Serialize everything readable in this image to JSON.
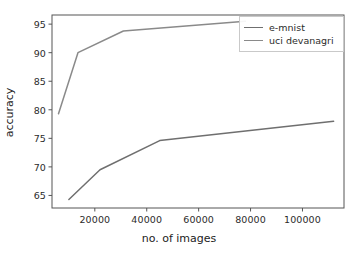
{
  "chart_data": {
    "type": "line",
    "title": "",
    "xlabel": "no. of images",
    "ylabel": "accuracy",
    "xlim": [
      3500,
      116000
    ],
    "ylim": [
      62.8,
      96.6
    ],
    "xticks": [
      20000,
      40000,
      60000,
      80000,
      100000
    ],
    "xtick_labels": [
      "20000",
      "40000",
      "60000",
      "80000",
      "100000"
    ],
    "yticks": [
      65,
      70,
      75,
      80,
      85,
      90,
      95
    ],
    "ytick_labels": [
      "65",
      "70",
      "75",
      "80",
      "85",
      "90",
      "95"
    ],
    "grid": false,
    "legend_position": "upper right",
    "series": [
      {
        "name": "e-mnist",
        "color": "#6f6f6f",
        "x": [
          10000,
          22000,
          45000,
          112000
        ],
        "y": [
          64.3,
          69.5,
          74.6,
          78.0
        ]
      },
      {
        "name": "uci devanagri",
        "color": "#8a8a8a",
        "x": [
          6000,
          13500,
          31000,
          78000
        ],
        "y": [
          79.3,
          90.0,
          93.8,
          95.5
        ]
      }
    ]
  },
  "legend": {
    "entries": [
      {
        "label": "e-mnist"
      },
      {
        "label": "uci devanagri"
      }
    ]
  },
  "axes": {
    "spine_color": "#555555",
    "tick_color": "#555555"
  }
}
